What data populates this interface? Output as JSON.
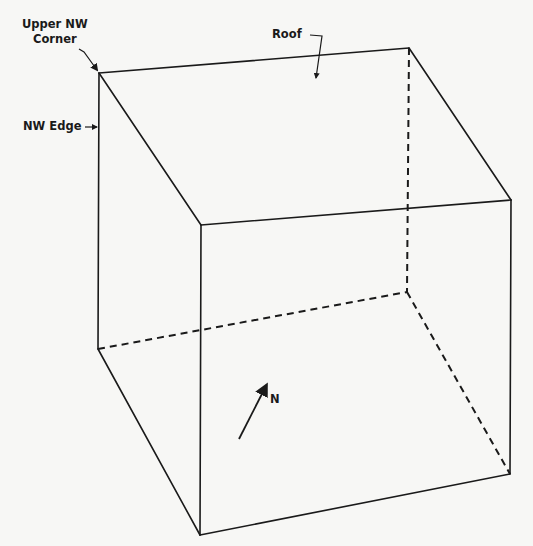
{
  "diagram": {
    "title": "",
    "type": "isometric-box",
    "stroke_color": "#1a1a1a",
    "background_color": "#f7f7f5",
    "labels": {
      "upper_nw_corner_line1": "Upper NW",
      "upper_nw_corner_line2": "Corner",
      "nw_edge": "NW Edge",
      "roof": "Roof",
      "north": "N"
    },
    "vertices": {
      "upper_nw": [
        99,
        73
      ],
      "upper_ne_back": [
        409,
        48
      ],
      "upper_front_right": [
        511,
        200
      ],
      "upper_front_left": [
        201,
        225
      ],
      "lower_nw": [
        98,
        349
      ],
      "lower_back_hidden": [
        407,
        292
      ],
      "lower_front_right": [
        510,
        474
      ],
      "lower_front_left": [
        200,
        535
      ]
    },
    "solid_edges": [
      [
        "upper_nw",
        "upper_ne_back"
      ],
      [
        "upper_ne_back",
        "upper_front_right"
      ],
      [
        "upper_front_right",
        "upper_front_left"
      ],
      [
        "upper_front_left",
        "upper_nw"
      ],
      [
        "upper_nw",
        "lower_nw"
      ],
      [
        "lower_nw",
        "lower_front_left"
      ],
      [
        "upper_front_left",
        "lower_front_left"
      ],
      [
        "upper_front_right",
        "lower_front_right"
      ],
      [
        "lower_front_left",
        "lower_front_right"
      ]
    ],
    "hidden_edges": [
      [
        "upper_ne_back",
        "lower_back_hidden"
      ],
      [
        "lower_nw",
        "lower_back_hidden"
      ],
      [
        "lower_back_hidden",
        "lower_front_right"
      ]
    ]
  }
}
